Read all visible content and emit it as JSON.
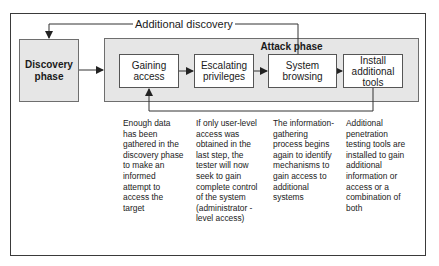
{
  "diagram": {
    "loop_label": "Additional discovery",
    "discovery_phase": "Discovery phase",
    "attack_phase": {
      "title": "Attack phase",
      "steps": [
        {
          "label": "Gaining access",
          "description": "Enough data has been gathered in the discovery phase to make an informed attempt to access the target"
        },
        {
          "label": "Escalating privileges",
          "description": "If only user-level access was obtained in the last step, the tester will now seek to gain complete control of the system (administrator -level access)"
        },
        {
          "label": "System browsing",
          "description": "The information-gathering process begins again to identify mechanisms to gain access to additional systems"
        },
        {
          "label": "Install additional tools",
          "description": "Additional penetration testing tools are installed to gain additional information or access or a combination of both"
        }
      ]
    },
    "colors": {
      "phase_fill": "#e6e6e6",
      "line": "#333333"
    }
  }
}
